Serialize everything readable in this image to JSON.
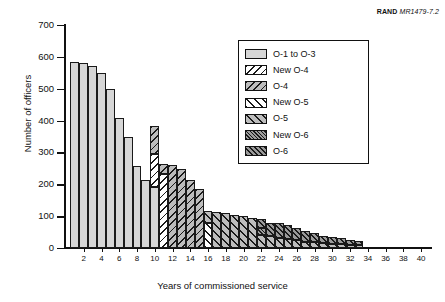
{
  "credit": {
    "brand": "RAND",
    "doc": "MR1479-7.2"
  },
  "chart_data": {
    "type": "bar",
    "stacked": true,
    "title": "",
    "xlabel": "Years of commissioned service",
    "ylabel": "Number of officers",
    "xlim": [
      0,
      41
    ],
    "ylim": [
      0,
      700
    ],
    "ytick_step": 100,
    "yticks": [
      0,
      100,
      200,
      300,
      400,
      500,
      600,
      700
    ],
    "ytick_labels": [
      "0",
      "100",
      "200",
      "300",
      "400",
      "500",
      "600",
      "700"
    ],
    "xticks": [
      2,
      4,
      6,
      8,
      10,
      12,
      14,
      16,
      18,
      20,
      22,
      24,
      26,
      28,
      30,
      32,
      34,
      36,
      38,
      40
    ],
    "xtick_labels": [
      "2",
      "4",
      "6",
      "8",
      "10",
      "12",
      "14",
      "16",
      "18",
      "20",
      "22",
      "24",
      "26",
      "28",
      "30",
      "32",
      "34",
      "36",
      "38",
      "40"
    ],
    "grid": false,
    "legend_position": "upper right",
    "colors": {
      "o1_to_o3": "#d6d6d6",
      "new_o4": "#ffffff",
      "o4": "#bdbdbd",
      "new_o5": "#ffffff",
      "o5": "#bdbdbd",
      "new_o6": "#9e9e9e",
      "o6": "#9a9a9a",
      "outline": "#1a1a1a"
    },
    "series": [
      {
        "name": "O-1 to O-3",
        "pattern": "solid-light-gray",
        "values": [
          585,
          580,
          570,
          550,
          500,
          408,
          348,
          257,
          212,
          192,
          0,
          0,
          0,
          0,
          0,
          0,
          0,
          0,
          0,
          0,
          0,
          0,
          0,
          0,
          0,
          0,
          0,
          0,
          0,
          0,
          0,
          0,
          0,
          0,
          0,
          0,
          0,
          0,
          0,
          0
        ]
      },
      {
        "name": "New O-4",
        "pattern": "backslash-hatch-white",
        "values": [
          0,
          0,
          0,
          0,
          0,
          0,
          0,
          0,
          0,
          103,
          233,
          0,
          0,
          0,
          0,
          0,
          0,
          0,
          0,
          0,
          0,
          0,
          0,
          0,
          0,
          0,
          0,
          0,
          0,
          0,
          0,
          0,
          0,
          0,
          0,
          0,
          0,
          0,
          0,
          0
        ]
      },
      {
        "name": "O-4",
        "pattern": "backslash-hatch-gray",
        "values": [
          0,
          0,
          0,
          0,
          0,
          0,
          0,
          0,
          0,
          89,
          32,
          260,
          248,
          214,
          184,
          0,
          0,
          0,
          0,
          0,
          0,
          0,
          0,
          0,
          0,
          0,
          0,
          0,
          0,
          0,
          0,
          0,
          0,
          0,
          0,
          0,
          0,
          0,
          0,
          0
        ]
      },
      {
        "name": "New O-5",
        "pattern": "forwardslash-wide-white",
        "values": [
          0,
          0,
          0,
          0,
          0,
          0,
          0,
          0,
          0,
          0,
          0,
          0,
          0,
          0,
          0,
          78,
          0,
          0,
          0,
          0,
          0,
          0,
          0,
          0,
          0,
          0,
          0,
          0,
          0,
          0,
          0,
          0,
          0,
          0,
          0,
          0,
          0,
          0,
          0,
          0
        ]
      },
      {
        "name": "O-5",
        "pattern": "forwardslash-wide-gray",
        "values": [
          0,
          0,
          0,
          0,
          0,
          0,
          0,
          0,
          0,
          0,
          0,
          0,
          0,
          0,
          0,
          37,
          114,
          110,
          104,
          102,
          94,
          40,
          38,
          32,
          28,
          24,
          20,
          18,
          16,
          14,
          12,
          10,
          8,
          0,
          0,
          0,
          0,
          0,
          0,
          0
        ]
      },
      {
        "name": "New O-6",
        "pattern": "dense-hatch-medium-gray",
        "values": [
          0,
          0,
          0,
          0,
          0,
          0,
          0,
          0,
          0,
          0,
          0,
          0,
          0,
          0,
          0,
          0,
          0,
          0,
          0,
          0,
          0,
          22,
          0,
          0,
          0,
          0,
          0,
          0,
          0,
          0,
          0,
          0,
          0,
          0,
          0,
          0,
          0,
          0,
          0,
          0
        ]
      },
      {
        "name": "O-6",
        "pattern": "dense-hatch-dark-gray",
        "values": [
          0,
          0,
          0,
          0,
          0,
          0,
          0,
          0,
          0,
          0,
          0,
          0,
          0,
          0,
          0,
          0,
          0,
          0,
          0,
          0,
          0,
          28,
          42,
          48,
          44,
          40,
          32,
          28,
          22,
          20,
          18,
          16,
          14,
          0,
          0,
          0,
          0,
          0,
          0,
          0
        ]
      }
    ],
    "bar_totals": [
      585,
      580,
      570,
      550,
      500,
      408,
      348,
      257,
      212,
      192,
      265,
      260,
      248,
      214,
      184,
      115,
      114,
      110,
      104,
      102,
      94,
      90,
      80,
      80,
      72,
      64,
      52,
      46,
      38,
      34,
      30,
      26,
      22,
      0,
      0,
      0,
      0,
      0,
      0,
      0
    ]
  },
  "legend": {
    "items": [
      {
        "label": "O-1 to O-3",
        "pattern": "p0"
      },
      {
        "label": "New O-4",
        "pattern": "p1"
      },
      {
        "label": "O-4",
        "pattern": "p2"
      },
      {
        "label": "New O-5",
        "pattern": "p3"
      },
      {
        "label": "O-5",
        "pattern": "p4"
      },
      {
        "label": "New O-6",
        "pattern": "p5"
      },
      {
        "label": "O-6",
        "pattern": "p6"
      }
    ]
  }
}
